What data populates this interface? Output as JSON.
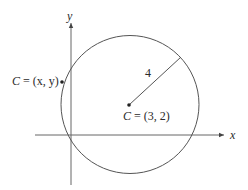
{
  "diagram": {
    "type": "circle-on-coordinate-plane",
    "axes": {
      "x_label": "x",
      "y_label": "y"
    },
    "circle": {
      "center_label_var": "C",
      "center_label_eq": " = (3, 2)",
      "radius_label": "4"
    },
    "point": {
      "label_var": "C",
      "label_eq": " = (x, y)"
    },
    "colors": {
      "stroke": "#555555",
      "text": "#2a2a2a"
    }
  }
}
